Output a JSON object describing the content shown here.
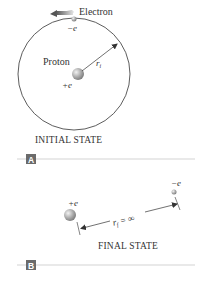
{
  "panel_a": {
    "electron_label": "Electron",
    "electron_charge": "−e",
    "proton_label": "Proton",
    "proton_charge": "+e",
    "radius_label": "r",
    "radius_subscript": "i",
    "caption": "INITIAL STATE",
    "badge": "A"
  },
  "panel_b": {
    "proton_charge": "+e",
    "electron_charge": "−e",
    "distance_label": "r",
    "distance_subscript": "f",
    "distance_value": " = ∞",
    "caption": "FINAL STATE",
    "badge": "B"
  },
  "colors": {
    "line": "#333333",
    "divider": "#c8c8c8",
    "badge_bg": "#6b6b6b",
    "sphere_light": "#e6e6e6",
    "sphere_dark": "#8a8a8a",
    "arrow": "#555555"
  },
  "icons": {
    "motion_arrow": "left-arrow",
    "proton_sphere": "sphere",
    "electron_sphere": "small-sphere"
  }
}
